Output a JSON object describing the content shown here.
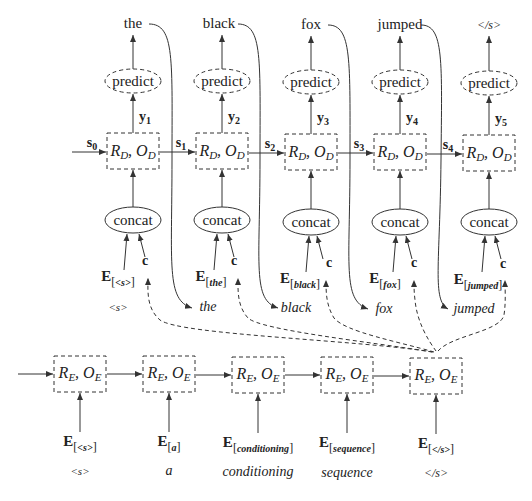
{
  "diagram": {
    "type": "encoder-decoder-rnn",
    "colors": {
      "line": "#333333",
      "text": "#222222",
      "background": "#ffffff"
    }
  },
  "decoder": {
    "outputs": [
      "the",
      "black",
      "fox",
      "jumped",
      "</s>"
    ],
    "predict_label": "predict",
    "concat_label": "concat",
    "cell_label": {
      "R": "R",
      "R_sub": "D",
      "O": "O",
      "O_sub": "D"
    },
    "y_labels": [
      {
        "name": "y",
        "sub": "1"
      },
      {
        "name": "y",
        "sub": "2"
      },
      {
        "name": "y",
        "sub": "3"
      },
      {
        "name": "y",
        "sub": "4"
      },
      {
        "name": "y",
        "sub": "5"
      }
    ],
    "s_labels": [
      {
        "name": "s",
        "sub": "0"
      },
      {
        "name": "s",
        "sub": "1"
      },
      {
        "name": "s",
        "sub": "2"
      },
      {
        "name": "s",
        "sub": "3"
      },
      {
        "name": "s",
        "sub": "4"
      }
    ],
    "context_label": "c",
    "embeddings": [
      "<s>",
      "the",
      "black",
      "fox",
      "jumped"
    ],
    "input_words": [
      "<s>",
      "the",
      "black",
      "fox",
      "jumped"
    ]
  },
  "encoder": {
    "cell_label": {
      "R": "R",
      "R_sub": "E",
      "O": "O",
      "O_sub": "E"
    },
    "embeddings": [
      "<s>",
      "a",
      "conditioning",
      "sequence",
      "</s>"
    ],
    "input_words": [
      "<s>",
      "a",
      "conditioning",
      "sequence",
      "</s>"
    ]
  },
  "embedding_symbol": "E"
}
